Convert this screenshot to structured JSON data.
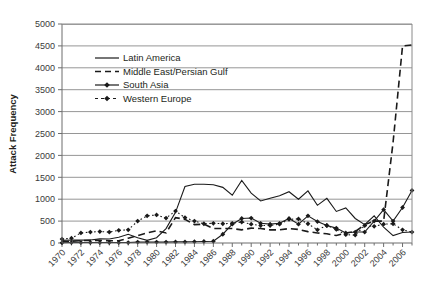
{
  "chart_data": {
    "type": "line",
    "title": "",
    "xlabel": "",
    "ylabel": "Attack Frequency",
    "ylim": [
      0,
      5000
    ],
    "ytick_step": 500,
    "yticks": [
      "0",
      "500",
      "1000",
      "1500",
      "2000",
      "2500",
      "3000",
      "3500",
      "4000",
      "4500",
      "5000"
    ],
    "xlim": [
      1970,
      2007
    ],
    "xticks": [
      "1970",
      "1972",
      "1974",
      "1976",
      "1978",
      "1980",
      "1982",
      "1984",
      "1986",
      "1988",
      "1990",
      "1992",
      "1994",
      "1996",
      "1998",
      "2000",
      "2002",
      "2004",
      "2006"
    ],
    "x": [
      1970,
      1971,
      1972,
      1973,
      1974,
      1975,
      1976,
      1977,
      1978,
      1979,
      1980,
      1981,
      1982,
      1983,
      1984,
      1985,
      1986,
      1987,
      1988,
      1989,
      1990,
      1991,
      1992,
      1993,
      1994,
      1995,
      1996,
      1997,
      1998,
      1999,
      2000,
      2001,
      2002,
      2003,
      2004,
      2005,
      2006,
      2007
    ],
    "grid": true,
    "legend_position": "upper-left-inside",
    "series": [
      {
        "name": "Latin America",
        "style": "solid",
        "marker": "none",
        "color": "#1a1a1a",
        "values": [
          60,
          70,
          65,
          70,
          95,
          90,
          130,
          200,
          120,
          60,
          120,
          330,
          700,
          1290,
          1340,
          1340,
          1330,
          1270,
          1090,
          1430,
          1140,
          960,
          1020,
          1080,
          1170,
          1000,
          1190,
          860,
          1020,
          720,
          800,
          560,
          420,
          620,
          360,
          170,
          240,
          250
        ]
      },
      {
        "name": "Middle East/Persian Gulf",
        "style": "dashed",
        "marker": "none",
        "color": "#1a1a1a",
        "values": [
          30,
          35,
          55,
          60,
          60,
          50,
          50,
          110,
          170,
          230,
          280,
          230,
          580,
          540,
          420,
          430,
          330,
          330,
          330,
          300,
          340,
          330,
          300,
          300,
          330,
          310,
          260,
          230,
          210,
          170,
          230,
          260,
          420,
          500,
          500,
          2300,
          4500,
          4520
        ]
      },
      {
        "name": "South Asia",
        "style": "solid",
        "marker": "diamond",
        "color": "#1a1a1a",
        "values": [
          5,
          10,
          10,
          10,
          10,
          10,
          10,
          10,
          20,
          20,
          20,
          20,
          25,
          25,
          30,
          35,
          40,
          200,
          430,
          560,
          570,
          450,
          430,
          450,
          560,
          430,
          620,
          490,
          400,
          340,
          230,
          250,
          250,
          500,
          760,
          500,
          810,
          1200
        ]
      },
      {
        "name": "Western Europe",
        "style": "dotted",
        "marker": "diamond",
        "color": "#1a1a1a",
        "values": [
          90,
          110,
          230,
          250,
          260,
          250,
          290,
          300,
          500,
          620,
          640,
          570,
          730,
          580,
          500,
          440,
          450,
          440,
          450,
          480,
          430,
          400,
          400,
          430,
          540,
          550,
          440,
          300,
          400,
          310,
          190,
          180,
          400,
          380,
          430,
          440,
          300,
          250
        ]
      }
    ]
  },
  "legend": {
    "items": [
      {
        "label": "Latin America"
      },
      {
        "label": "Middle East/Persian Gulf"
      },
      {
        "label": "South Asia"
      },
      {
        "label": "Western Europe"
      }
    ]
  }
}
